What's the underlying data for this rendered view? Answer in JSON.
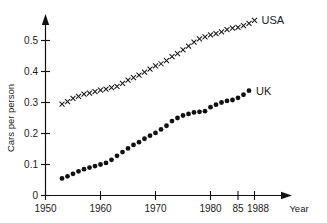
{
  "chart_data": {
    "type": "scatter",
    "title": "",
    "subtitle": "",
    "xlabel": "Year",
    "ylabel": "Cars per person",
    "xlim": [
      1950,
      1990
    ],
    "ylim": [
      0,
      0.58
    ],
    "grid": false,
    "legend_position": "right-of-series-end",
    "x_ticks": [
      1950,
      1960,
      1970,
      1980,
      1985,
      1988
    ],
    "x_tick_labels": [
      "1950",
      "1960",
      "1970",
      "1980",
      "85",
      "1988"
    ],
    "y_ticks": [
      0,
      0.1,
      0.2,
      0.3,
      0.4,
      0.5
    ],
    "y_tick_labels": [
      "0",
      "0.1",
      "0.2",
      "0.3",
      "0.4",
      "0.5"
    ],
    "series": [
      {
        "name": "USA",
        "marker": "x",
        "x": [
          1953,
          1954,
          1955,
          1956,
          1957,
          1958,
          1959,
          1960,
          1961,
          1962,
          1963,
          1964,
          1965,
          1966,
          1967,
          1968,
          1969,
          1970,
          1971,
          1972,
          1973,
          1974,
          1975,
          1976,
          1977,
          1978,
          1979,
          1980,
          1981,
          1982,
          1983,
          1984,
          1985,
          1986,
          1987,
          1988
        ],
        "values": [
          0.295,
          0.303,
          0.313,
          0.32,
          0.327,
          0.33,
          0.335,
          0.34,
          0.343,
          0.348,
          0.352,
          0.362,
          0.372,
          0.38,
          0.388,
          0.398,
          0.408,
          0.418,
          0.425,
          0.435,
          0.448,
          0.458,
          0.47,
          0.482,
          0.495,
          0.505,
          0.512,
          0.518,
          0.522,
          0.528,
          0.535,
          0.54,
          0.542,
          0.548,
          0.555,
          0.565
        ]
      },
      {
        "name": "UK",
        "marker": "filled-circle",
        "x": [
          1953,
          1954,
          1955,
          1956,
          1957,
          1958,
          1959,
          1960,
          1961,
          1962,
          1963,
          1964,
          1965,
          1966,
          1967,
          1968,
          1969,
          1970,
          1971,
          1972,
          1973,
          1974,
          1975,
          1976,
          1977,
          1978,
          1979,
          1980,
          1981,
          1982,
          1983,
          1984,
          1985,
          1986,
          1987
        ],
        "values": [
          0.055,
          0.062,
          0.07,
          0.078,
          0.085,
          0.09,
          0.095,
          0.1,
          0.105,
          0.115,
          0.128,
          0.14,
          0.152,
          0.163,
          0.172,
          0.183,
          0.193,
          0.202,
          0.213,
          0.225,
          0.24,
          0.25,
          0.258,
          0.263,
          0.268,
          0.27,
          0.272,
          0.285,
          0.293,
          0.3,
          0.305,
          0.308,
          0.315,
          0.325,
          0.338
        ]
      }
    ]
  },
  "labels": {
    "usa": "USA",
    "uk": "UK"
  },
  "colors": {
    "ink": "#111111",
    "background": "#ffffff"
  }
}
